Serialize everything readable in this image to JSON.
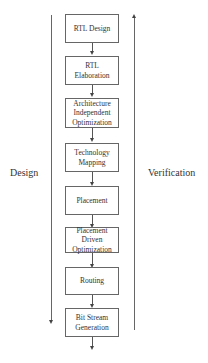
{
  "diagram": {
    "left_label": "Design",
    "right_label": "Verification",
    "steps": [
      "RTL Design",
      "RTL Elaboration",
      "Architecture Independent Optimization",
      "Technology Mapping",
      "Placement",
      "Placement Driven Optimization",
      "Routing",
      "Bit Stream Generation"
    ]
  }
}
